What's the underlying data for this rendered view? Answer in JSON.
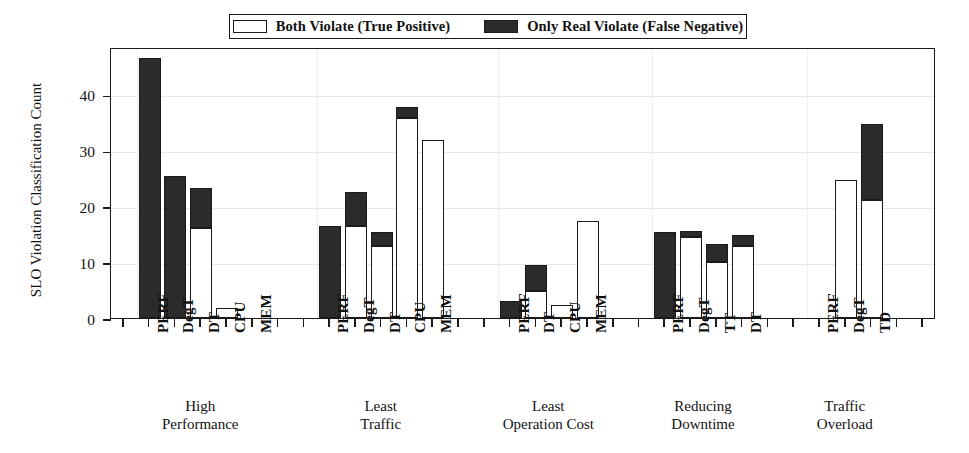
{
  "chart_data": {
    "type": "bar",
    "title": "",
    "xlabel": "",
    "ylabel": "SLO Violation Classification Count",
    "ylim": [
      0,
      48.5
    ],
    "yticks": [
      0,
      10,
      20,
      30,
      40
    ],
    "grid": true,
    "stacked": true,
    "legend_position": "top-center",
    "legend": [
      {
        "name": "Both Violate (True Positive)",
        "color": "#ffffff",
        "edge": "#1a1a1a"
      },
      {
        "name": "Only Real Violate (False Negative)",
        "color": "#2b2b2b",
        "edge": "#1a1a1a"
      }
    ],
    "series": [
      {
        "name": "Both Violate (True Positive)",
        "values": [
          46.5,
          25.5,
          16.1,
          1.8,
          0,
          16.4,
          16.4,
          12.8,
          35.8,
          31.8,
          3.1,
          4.9,
          2.3,
          17.4,
          15.4,
          14.5,
          10.0,
          12.8,
          0,
          24.7,
          21.2
        ]
      },
      {
        "name": "Only Real Violate (False Negative)",
        "values": [
          0,
          0,
          5.8,
          0,
          0,
          0,
          6.1,
          2.6,
          1.9,
          0,
          0,
          4.6,
          0,
          0,
          0,
          1.0,
          3.3,
          2.0,
          0,
          0,
          13.6
        ]
      }
    ],
    "bars": [
      {
        "group": 0,
        "label": "PERF",
        "tp": 0,
        "fn": 46.5,
        "total": 46.5
      },
      {
        "group": 0,
        "label": "DegT",
        "tp": 0,
        "fn": 25.5,
        "total": 25.5
      },
      {
        "group": 0,
        "label": "DT",
        "tp": 16.1,
        "fn": 7.1,
        "total": 23.2
      },
      {
        "group": 0,
        "label": "CPU",
        "tp": 1.8,
        "fn": 0,
        "total": 1.8
      },
      {
        "group": 0,
        "label": "MEM",
        "tp": 0,
        "fn": 0,
        "total": 0
      },
      {
        "group": 1,
        "label": "PERF",
        "tp": 0,
        "fn": 16.4,
        "total": 16.4
      },
      {
        "group": 1,
        "label": "DegT",
        "tp": 16.4,
        "fn": 6.1,
        "total": 22.5
      },
      {
        "group": 1,
        "label": "DT",
        "tp": 12.8,
        "fn": 2.6,
        "total": 15.4
      },
      {
        "group": 1,
        "label": "CPU",
        "tp": 35.8,
        "fn": 1.9,
        "total": 37.7
      },
      {
        "group": 1,
        "label": "MEM",
        "tp": 31.8,
        "fn": 0,
        "total": 31.8
      },
      {
        "group": 2,
        "label": "PERF",
        "tp": 0,
        "fn": 3.1,
        "total": 3.1
      },
      {
        "group": 2,
        "label": "DT",
        "tp": 4.9,
        "fn": 4.6,
        "total": 9.5
      },
      {
        "group": 2,
        "label": "CPU",
        "tp": 2.3,
        "fn": 0,
        "total": 2.3
      },
      {
        "group": 2,
        "label": "MEM",
        "tp": 17.4,
        "fn": 0,
        "total": 17.4
      },
      {
        "group": 3,
        "label": "PERF",
        "tp": 0,
        "fn": 15.4,
        "total": 15.4
      },
      {
        "group": 3,
        "label": "DegT",
        "tp": 14.5,
        "fn": 1.0,
        "total": 15.5
      },
      {
        "group": 3,
        "label": "TT",
        "tp": 10.0,
        "fn": 3.3,
        "total": 13.3
      },
      {
        "group": 3,
        "label": "DT",
        "tp": 12.8,
        "fn": 2.0,
        "total": 14.8
      },
      {
        "group": 4,
        "label": "PERF",
        "tp": 0,
        "fn": 0,
        "total": 0
      },
      {
        "group": 4,
        "label": "DegT",
        "tp": 24.7,
        "fn": 0,
        "total": 24.7
      },
      {
        "group": 4,
        "label": "TD",
        "tp": 21.2,
        "fn": 13.6,
        "total": 34.8
      }
    ],
    "groups": [
      {
        "title": "High\nPerformance",
        "categories": [
          "PERF",
          "DegT",
          "DT",
          "CPU",
          "MEM"
        ]
      },
      {
        "title": "Least\nTraffic",
        "categories": [
          "PERF",
          "DegT",
          "DT",
          "CPU",
          "MEM"
        ]
      },
      {
        "title": "Least\nOperation Cost",
        "categories": [
          "PERF",
          "DT",
          "CPU",
          "MEM"
        ]
      },
      {
        "title": "Reducing\nDowntime",
        "categories": [
          "PERF",
          "DegT",
          "TT",
          "DT"
        ]
      },
      {
        "title": "Traffic\nOverload",
        "categories": [
          "PERF",
          "DegT",
          "TD"
        ]
      }
    ]
  }
}
